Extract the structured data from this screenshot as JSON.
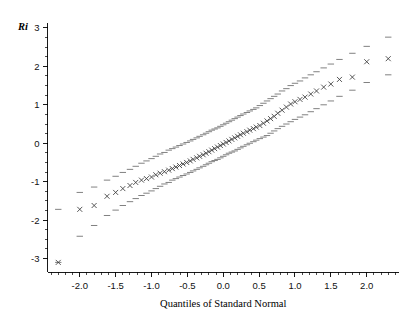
{
  "chart_data": {
    "type": "scatter",
    "title": "",
    "xlabel": "Quantiles of Standard Normal",
    "ylabel": "Ri",
    "xlim": [
      -2.45,
      2.45
    ],
    "ylim": [
      -3.35,
      3.05
    ],
    "grid": false,
    "legend": "none",
    "x_ticks": [
      -2.0,
      -1.5,
      -1.0,
      -0.5,
      0.0,
      0.5,
      1.0,
      1.5,
      2.0
    ],
    "x_tick_labels": [
      "-2.0",
      "-1.5",
      "-1.0",
      "-0.5",
      "0.0",
      "0.5",
      "1.0",
      "1.5",
      "2.0"
    ],
    "x_minor_step": 0.1,
    "y_ticks": [
      3,
      2,
      1,
      0,
      -1,
      -2,
      -3
    ],
    "y_tick_labels": [
      "3",
      "2",
      "1",
      "0",
      "-1",
      "-2",
      "-3"
    ],
    "y_minor_step": 0.25,
    "marker": "x",
    "band_marker": "dash",
    "series": [
      {
        "name": "Ri quantiles",
        "x": [
          -2.3,
          -2.0,
          -1.8,
          -1.62,
          -1.5,
          -1.4,
          -1.3,
          -1.22,
          -1.14,
          -1.07,
          -1.0,
          -0.94,
          -0.88,
          -0.82,
          -0.76,
          -0.71,
          -0.66,
          -0.61,
          -0.56,
          -0.51,
          -0.46,
          -0.42,
          -0.37,
          -0.33,
          -0.28,
          -0.24,
          -0.2,
          -0.16,
          -0.12,
          -0.08,
          -0.04,
          0.0,
          0.04,
          0.08,
          0.12,
          0.16,
          0.2,
          0.24,
          0.28,
          0.33,
          0.37,
          0.42,
          0.46,
          0.51,
          0.56,
          0.61,
          0.66,
          0.71,
          0.76,
          0.82,
          0.88,
          0.94,
          1.0,
          1.07,
          1.14,
          1.22,
          1.3,
          1.4,
          1.5,
          1.62,
          1.8,
          2.0,
          2.3
        ],
        "y": [
          -3.1,
          -1.72,
          -1.62,
          -1.38,
          -1.28,
          -1.18,
          -1.1,
          -1.02,
          -0.96,
          -0.92,
          -0.88,
          -0.82,
          -0.78,
          -0.74,
          -0.7,
          -0.66,
          -0.62,
          -0.58,
          -0.54,
          -0.5,
          -0.46,
          -0.42,
          -0.38,
          -0.34,
          -0.3,
          -0.26,
          -0.22,
          -0.18,
          -0.14,
          -0.1,
          -0.06,
          -0.02,
          0.02,
          0.06,
          0.1,
          0.14,
          0.18,
          0.22,
          0.26,
          0.3,
          0.34,
          0.38,
          0.42,
          0.46,
          0.52,
          0.58,
          0.64,
          0.7,
          0.78,
          0.86,
          0.94,
          1.02,
          1.08,
          1.14,
          1.2,
          1.28,
          1.36,
          1.46,
          1.54,
          1.66,
          1.72,
          2.12,
          2.2
        ]
      }
    ],
    "upper_band": {
      "name": "upper envelope",
      "x": [
        -2.3,
        -2.0,
        -1.8,
        -1.62,
        -1.5,
        -1.4,
        -1.3,
        -1.22,
        -1.14,
        -1.07,
        -1.0,
        -0.94,
        -0.88,
        -0.82,
        -0.76,
        -0.71,
        -0.66,
        -0.61,
        -0.56,
        -0.51,
        -0.46,
        -0.42,
        -0.37,
        -0.33,
        -0.28,
        -0.24,
        -0.2,
        -0.16,
        -0.12,
        -0.08,
        -0.04,
        0.0,
        0.04,
        0.08,
        0.12,
        0.16,
        0.2,
        0.24,
        0.28,
        0.33,
        0.37,
        0.42,
        0.46,
        0.51,
        0.56,
        0.61,
        0.66,
        0.71,
        0.76,
        0.82,
        0.88,
        0.94,
        1.0,
        1.07,
        1.14,
        1.22,
        1.3,
        1.4,
        1.5,
        1.62,
        1.8,
        2.0,
        2.3
      ],
      "y": [
        -1.72,
        -1.28,
        -1.14,
        -0.96,
        -0.86,
        -0.76,
        -0.68,
        -0.6,
        -0.52,
        -0.46,
        -0.4,
        -0.34,
        -0.28,
        -0.24,
        -0.18,
        -0.14,
        -0.1,
        -0.06,
        -0.02,
        0.02,
        0.06,
        0.1,
        0.14,
        0.18,
        0.22,
        0.26,
        0.3,
        0.34,
        0.37,
        0.4,
        0.44,
        0.48,
        0.52,
        0.56,
        0.6,
        0.64,
        0.68,
        0.72,
        0.76,
        0.8,
        0.84,
        0.88,
        0.92,
        0.98,
        1.04,
        1.1,
        1.16,
        1.22,
        1.28,
        1.36,
        1.42,
        1.5,
        1.56,
        1.62,
        1.7,
        1.78,
        1.86,
        1.96,
        2.06,
        2.18,
        2.34,
        2.52,
        2.76
      ]
    },
    "lower_band": {
      "name": "lower envelope",
      "x": [
        -2.3,
        -2.0,
        -1.8,
        -1.62,
        -1.5,
        -1.4,
        -1.3,
        -1.22,
        -1.14,
        -1.07,
        -1.0,
        -0.94,
        -0.88,
        -0.82,
        -0.76,
        -0.71,
        -0.66,
        -0.61,
        -0.56,
        -0.51,
        -0.46,
        -0.42,
        -0.37,
        -0.33,
        -0.28,
        -0.24,
        -0.2,
        -0.16,
        -0.12,
        -0.08,
        -0.04,
        0.0,
        0.04,
        0.08,
        0.12,
        0.16,
        0.2,
        0.24,
        0.28,
        0.33,
        0.37,
        0.42,
        0.46,
        0.51,
        0.56,
        0.61,
        0.66,
        0.71,
        0.76,
        0.82,
        0.88,
        0.94,
        1.0,
        1.07,
        1.14,
        1.22,
        1.3,
        1.4,
        1.5,
        1.62,
        1.8,
        2.0,
        2.3
      ],
      "y": [
        -3.1,
        -2.42,
        -2.14,
        -1.88,
        -1.74,
        -1.62,
        -1.52,
        -1.44,
        -1.36,
        -1.3,
        -1.24,
        -1.18,
        -1.12,
        -1.06,
        -1.02,
        -0.96,
        -0.92,
        -0.88,
        -0.84,
        -0.8,
        -0.76,
        -0.72,
        -0.68,
        -0.64,
        -0.6,
        -0.56,
        -0.52,
        -0.48,
        -0.45,
        -0.42,
        -0.38,
        -0.34,
        -0.3,
        -0.26,
        -0.23,
        -0.2,
        -0.16,
        -0.12,
        -0.08,
        -0.04,
        0.0,
        0.04,
        0.08,
        0.12,
        0.16,
        0.2,
        0.26,
        0.32,
        0.38,
        0.44,
        0.5,
        0.56,
        0.62,
        0.68,
        0.74,
        0.82,
        0.9,
        1.0,
        1.1,
        1.22,
        1.38,
        1.58,
        1.78
      ]
    }
  }
}
